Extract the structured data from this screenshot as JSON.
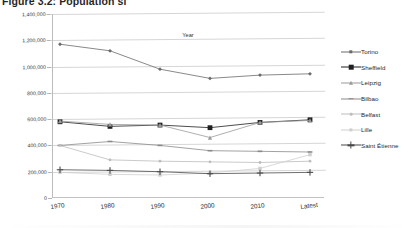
{
  "figure": {
    "title": "Figure 3.2: Population si"
  },
  "chart_data": {
    "type": "line",
    "title": "Figure 3.2: Population si",
    "xlabel": "Year",
    "ylabel": "",
    "categories": [
      "1970",
      "1980",
      "1990",
      "2000",
      "2010",
      "Latest"
    ],
    "ylim": [
      0,
      1400000
    ],
    "ytick_labels": [
      "0",
      "200,000",
      "400,000",
      "600,000",
      "800,000",
      "1,000,000",
      "1,200,000",
      "1,400,000"
    ],
    "ytick_values": [
      0,
      200000,
      400000,
      600000,
      800000,
      1000000,
      1200000,
      1400000
    ],
    "grid": true,
    "legend_position": "right",
    "series": [
      {
        "name": "Torino",
        "marker": "diamond",
        "color": "#6b6b6b",
        "values": [
          1170000,
          1120000,
          980000,
          910000,
          935000,
          945000
        ]
      },
      {
        "name": "Sheffield",
        "marker": "square",
        "color": "#1f1f1f",
        "values": [
          580000,
          545000,
          555000,
          535000,
          575000,
          595000
        ]
      },
      {
        "name": "Leipzig",
        "marker": "triangle",
        "color": "#9a9a9a",
        "values": [
          585000,
          560000,
          555000,
          460000,
          575000,
          590000
        ]
      },
      {
        "name": "Bilbao",
        "marker": "dash",
        "color": "#8a8a8a",
        "values": [
          400000,
          430000,
          400000,
          360000,
          355000,
          350000
        ]
      },
      {
        "name": "Belfast",
        "marker": "dot",
        "color": "#bdbdbd",
        "values": [
          400000,
          290000,
          280000,
          275000,
          270000,
          280000
        ]
      },
      {
        "name": "Lille",
        "marker": "square-small",
        "color": "#cfcfcf",
        "values": [
          195000,
          180000,
          175000,
          190000,
          225000,
          330000
        ]
      },
      {
        "name": "Saint Étienne",
        "marker": "plus",
        "color": "#4a4a4a",
        "values": [
          215000,
          210000,
          200000,
          185000,
          190000,
          195000
        ]
      }
    ]
  }
}
